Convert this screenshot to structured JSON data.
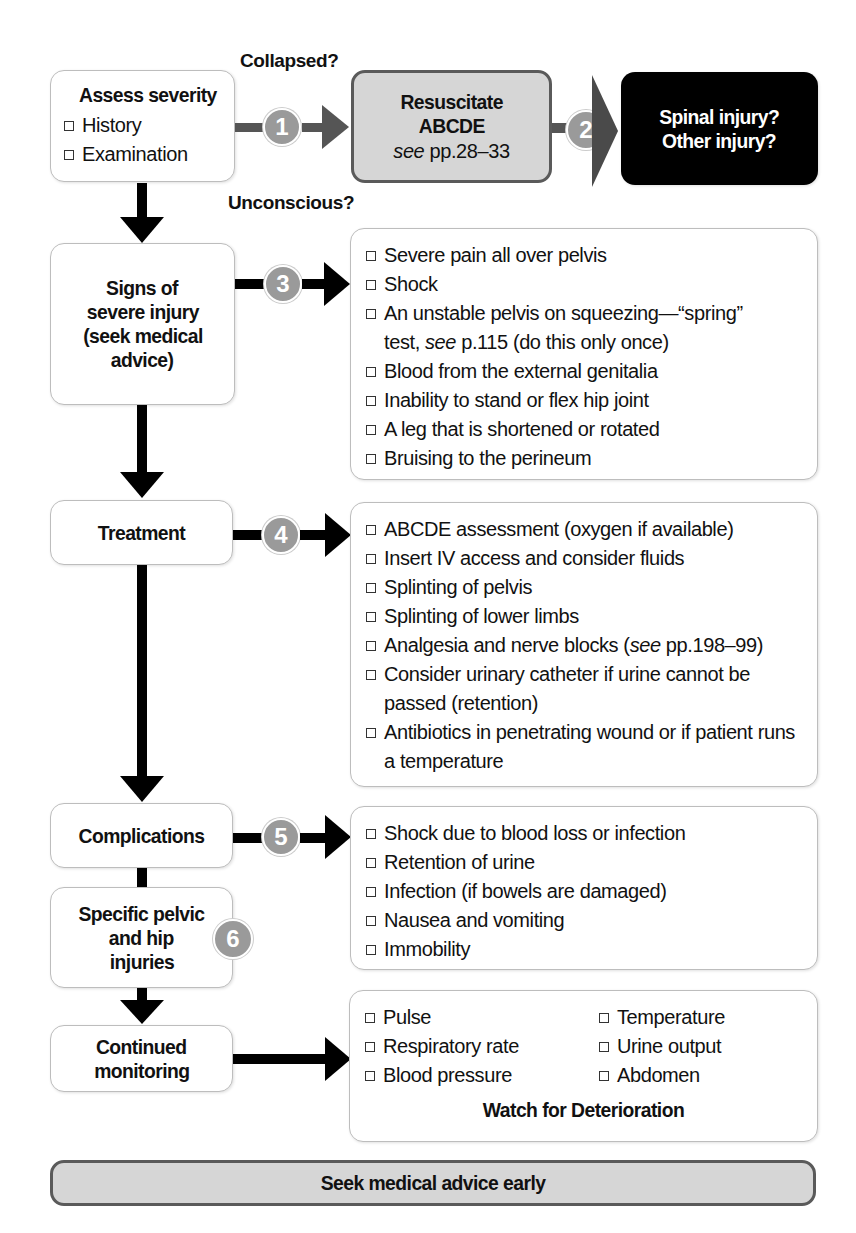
{
  "labels": {
    "collapsed": "Collapsed?",
    "unconscious": "Unconscious?"
  },
  "assess": {
    "title": "Assess severity",
    "items": [
      "History",
      "Examination"
    ]
  },
  "resuscitate": {
    "line1": "Resuscitate",
    "line2": "ABCDE",
    "ref_prefix": "see",
    "ref_pages": " pp.28–33"
  },
  "spinal": {
    "line1": "Spinal injury?",
    "line2": "Other injury?"
  },
  "steps": {
    "one": "1",
    "two": "2",
    "three": "3",
    "four": "4",
    "five": "5",
    "six": "6"
  },
  "signs": {
    "title_lines": [
      "Signs of",
      "severe injury",
      "(seek medical",
      "advice)"
    ],
    "items": [
      "Severe pain all over pelvis",
      "Shock",
      "An unstable pelvis on squeezing—“spring” test, see p.115 (do this only once)",
      "Blood from the external genitalia",
      "Inability to stand or flex hip joint",
      "A leg that is shortened or rotated",
      "Bruising to the perineum"
    ],
    "item3_part1": "An unstable pelvis on squeezing—“spring”",
    "item3_part2a": "test, ",
    "item3_part2_italic": "see",
    "item3_part2b": " p.115 (do this only once)"
  },
  "treatment": {
    "title": "Treatment",
    "items": [
      "ABCDE assessment (oxygen if available)",
      "Insert IV access and consider fluids",
      "Splinting of pelvis",
      "Splinting of lower limbs",
      "Analgesia and nerve blocks (see pp.198–99)",
      "Consider urinary catheter if urine cannot be passed (retention)",
      "Antibiotics in penetrating wound or if patient runs a temperature"
    ],
    "item5_part1": "Analgesia and nerve blocks (",
    "item5_italic": "see",
    "item5_part2": " pp.198–99)"
  },
  "complications": {
    "title": "Complications",
    "items": [
      "Shock due to blood loss or infection",
      "Retention of urine",
      "Infection (if bowels are damaged)",
      "Nausea and vomiting",
      "Immobility"
    ]
  },
  "specific": {
    "title_lines": [
      "Specific pelvic",
      "and hip",
      "injuries"
    ]
  },
  "monitoring": {
    "title_lines": [
      "Continued",
      "monitoring"
    ],
    "left_items": [
      "Pulse",
      "Respiratory rate",
      "Blood pressure"
    ],
    "right_items": [
      "Temperature",
      "Urine output",
      "Abdomen"
    ],
    "footer": "Watch for Deterioration"
  },
  "seek_bar": {
    "label": "Seek medical advice early"
  },
  "colors": {
    "grey_fill": "#d6d6d6",
    "grey_border": "#5a5a5a",
    "step_circle": "#9a9a9a",
    "black_box": "#000000",
    "connector_grey": "#555555"
  }
}
